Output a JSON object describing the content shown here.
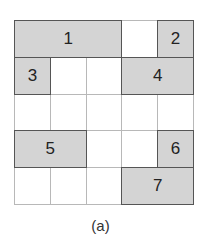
{
  "grid": {
    "rows": 5,
    "cols": 5,
    "colors": {
      "block_fill": "#d4d4d4",
      "empty_fill": "#ffffff",
      "block_border": "#555555",
      "grid_line": "#b8b8b8"
    }
  },
  "blocks": [
    {
      "label": "1",
      "row": 0,
      "col": 0,
      "rowspan": 1,
      "colspan": 3
    },
    {
      "label": "2",
      "row": 0,
      "col": 4,
      "rowspan": 1,
      "colspan": 1
    },
    {
      "label": "3",
      "row": 1,
      "col": 0,
      "rowspan": 1,
      "colspan": 1
    },
    {
      "label": "4",
      "row": 1,
      "col": 3,
      "rowspan": 1,
      "colspan": 2
    },
    {
      "label": "5",
      "row": 3,
      "col": 0,
      "rowspan": 1,
      "colspan": 2
    },
    {
      "label": "6",
      "row": 3,
      "col": 4,
      "rowspan": 1,
      "colspan": 1
    },
    {
      "label": "7",
      "row": 4,
      "col": 3,
      "rowspan": 1,
      "colspan": 2
    }
  ],
  "caption": "(a)"
}
